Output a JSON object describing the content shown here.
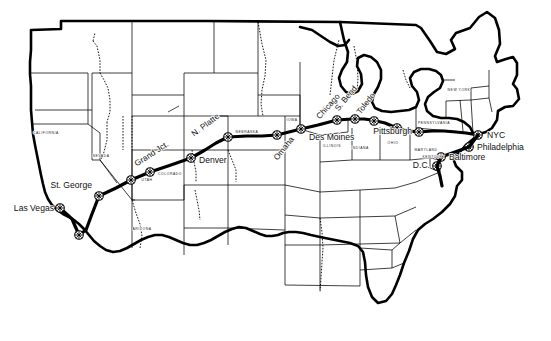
{
  "map": {
    "title": "US Interstate Route Map",
    "description": "Black-and-white outline map of the contiguous United States with a bold transcontinental route line running from Las Vegas to New York City",
    "background_color": "#ffffff",
    "line_color": "#000000",
    "route_color": "#000000",
    "cities": [
      {
        "name": "Las Vegas",
        "x": 60,
        "y": 208,
        "label_anchor": "end",
        "lx": 54,
        "ly": 211,
        "marker": true
      },
      {
        "name": "St. George",
        "x": 99,
        "y": 196,
        "label_anchor": "end",
        "lx": 92,
        "ly": 188,
        "marker": true
      },
      {
        "name": "Grand Jct.",
        "x": 150,
        "y": 172,
        "label_anchor": "mid",
        "lx": 153,
        "ly": 156,
        "marker": true,
        "rotate": -33
      },
      {
        "name": "Denver",
        "x": 191,
        "y": 158,
        "label_anchor": "start",
        "lx": 199,
        "ly": 162,
        "marker": true
      },
      {
        "name": "N. Platte",
        "x": 228,
        "y": 137,
        "label_anchor": "mid",
        "lx": 206,
        "ly": 126,
        "marker": true,
        "rotate": -37
      },
      {
        "name": "Omaha",
        "x": 277,
        "y": 135,
        "label_anchor": "mid",
        "lx": 283,
        "ly": 148,
        "marker": true,
        "rotate": -50
      },
      {
        "name": "Des Moines",
        "x": 301,
        "y": 129,
        "label_anchor": "start",
        "lx": 308,
        "ly": 139,
        "marker": true
      },
      {
        "name": "Chicago",
        "x": 337,
        "y": 120,
        "label_anchor": "mid",
        "lx": 330,
        "ly": 108,
        "marker": true,
        "rotate": -47
      },
      {
        "name": "S. Bend",
        "x": 352,
        "y": 119,
        "label_anchor": "mid",
        "lx": 346,
        "ly": 102,
        "marker": true,
        "rotate": -50
      },
      {
        "name": "Toledo",
        "x": 372,
        "y": 120,
        "label_anchor": "mid",
        "lx": 366,
        "ly": 107,
        "marker": true,
        "rotate": -52
      },
      {
        "name": "Pittsburgh",
        "x": 419,
        "y": 132,
        "label_anchor": "end",
        "lx": 412,
        "ly": 133,
        "marker": true
      },
      {
        "name": "NYC",
        "x": 478,
        "y": 135,
        "label_anchor": "start",
        "lx": 486,
        "ly": 138,
        "marker": true
      },
      {
        "name": "Philadelphia",
        "x": 469,
        "y": 147,
        "label_anchor": "start",
        "lx": 476,
        "ly": 150,
        "marker": true
      },
      {
        "name": "Baltimore",
        "x": 441,
        "y": 157,
        "label_anchor": "start",
        "lx": 448,
        "ly": 160,
        "marker": true
      },
      {
        "name": "D.C.",
        "x": 437,
        "y": 166,
        "label_anchor": "end",
        "lx": 431,
        "ly": 166,
        "marker": true
      }
    ],
    "extra_markers": [
      {
        "x": 79,
        "y": 235
      },
      {
        "x": 131,
        "y": 180
      },
      {
        "x": 397,
        "y": 128
      }
    ],
    "states": [
      {
        "name": "CALIFORNIA",
        "x": 46,
        "y": 133,
        "rotate": 0
      },
      {
        "name": "NEVADA",
        "x": 100,
        "y": 156,
        "rotate": 0
      },
      {
        "name": "UTAH",
        "x": 147,
        "y": 180,
        "rotate": 0
      },
      {
        "name": "ARIZONA",
        "x": 141,
        "y": 229,
        "rotate": 0
      },
      {
        "name": "COLORADO",
        "x": 151,
        "y": 181,
        "rotate": 0
      },
      {
        "name": "NEBRASKA",
        "x": 247,
        "y": 132,
        "rotate": 0
      },
      {
        "name": "IOWA",
        "x": 292,
        "y": 120,
        "rotate": 0
      },
      {
        "name": "ILLINOIS",
        "x": 331,
        "y": 146,
        "rotate": 0
      },
      {
        "name": "INDIANA",
        "x": 359,
        "y": 148,
        "rotate": 0
      },
      {
        "name": "OHIO",
        "x": 392,
        "y": 143,
        "rotate": 0
      },
      {
        "name": "PENNSYLVANIA",
        "x": 434,
        "y": 123,
        "rotate": 0
      },
      {
        "name": "NEW YORK",
        "x": 458,
        "y": 90,
        "rotate": 0
      },
      {
        "name": "MARYLAND",
        "x": 428,
        "y": 150,
        "rotate": 0
      },
      {
        "name": "KENTUCKY",
        "x": 426,
        "y": 154,
        "rotate": 0
      }
    ],
    "state_label_colorado": "COLORADO",
    "route_name": "transcontinental-route"
  }
}
